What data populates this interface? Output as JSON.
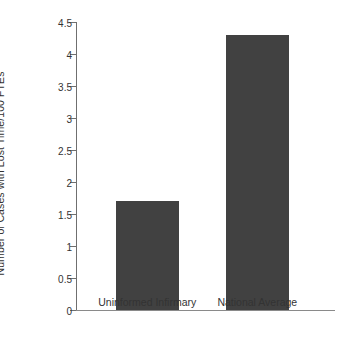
{
  "chart_data": {
    "type": "bar",
    "title": "",
    "subtitle": "",
    "xlabel": "",
    "ylabel": "Number of Cases with Lost Time/100 FTEs",
    "categories": [
      "Uninformed Infirmary",
      "National Average"
    ],
    "values": [
      1.7,
      4.3
    ],
    "ylim": [
      0,
      4.5
    ],
    "yticks": [
      0,
      0.5,
      1,
      1.5,
      2,
      2.5,
      3,
      3.5,
      4,
      4.5
    ],
    "ytick_labels": [
      "0",
      "0.5",
      "1",
      "1.5",
      "2",
      "2.5",
      "3",
      "3.5",
      "4",
      "4.5"
    ],
    "grid": false,
    "legend": null,
    "legend_position": "none",
    "bar_color": "#414141",
    "axis_color": "#6f6f6f",
    "background_color": "#ffffff",
    "annotations": []
  }
}
